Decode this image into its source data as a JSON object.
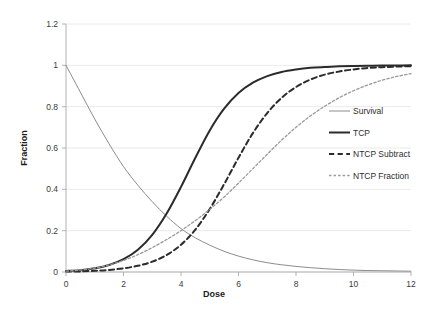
{
  "chart_data": {
    "type": "line",
    "title": "",
    "xlabel": "Dose",
    "ylabel": "Fraction",
    "xlim": [
      0,
      12
    ],
    "ylim": [
      0,
      1.2
    ],
    "xticks": [
      0,
      2,
      4,
      6,
      8,
      10,
      12
    ],
    "yticks": [
      0,
      0.2,
      0.4,
      0.6,
      0.8,
      1,
      1.2
    ],
    "xtick_labels": [
      "0",
      "2",
      "4",
      "6",
      "8",
      "10",
      "12"
    ],
    "ytick_labels": [
      "0",
      "0.2",
      "0.4",
      "0.6",
      "0.8",
      "1",
      "1.2"
    ],
    "grid": true,
    "legend_position": "right-middle",
    "series": [
      {
        "name": "Survival",
        "style": "solid",
        "color": "#8c8c8c",
        "width": 1.0,
        "x": [
          0,
          0.5,
          1,
          1.5,
          2,
          2.5,
          3,
          3.5,
          4,
          4.5,
          5,
          5.5,
          6,
          6.5,
          7,
          7.5,
          8,
          8.5,
          9,
          9.5,
          10,
          10.5,
          11,
          11.5,
          12
        ],
        "y": [
          1.0,
          0.87,
          0.74,
          0.62,
          0.51,
          0.42,
          0.34,
          0.27,
          0.21,
          0.165,
          0.13,
          0.1,
          0.077,
          0.059,
          0.045,
          0.035,
          0.027,
          0.021,
          0.016,
          0.012,
          0.009,
          0.007,
          0.006,
          0.005,
          0.004
        ]
      },
      {
        "name": "TCP",
        "style": "solid",
        "color": "#2b2b2b",
        "width": 2.0,
        "x": [
          0,
          0.5,
          1,
          1.5,
          2,
          2.5,
          3,
          3.5,
          4,
          4.5,
          5,
          5.5,
          6,
          6.5,
          7,
          7.5,
          8,
          8.5,
          9,
          9.5,
          10,
          10.5,
          11,
          11.5,
          12
        ],
        "y": [
          0.005,
          0.009,
          0.018,
          0.034,
          0.062,
          0.108,
          0.18,
          0.283,
          0.412,
          0.553,
          0.685,
          0.79,
          0.866,
          0.916,
          0.948,
          0.968,
          0.98,
          0.988,
          0.992,
          0.995,
          0.997,
          0.998,
          0.999,
          0.999,
          1.0
        ]
      },
      {
        "name": "NTCP Subtract",
        "style": "dashed",
        "color": "#2b2b2b",
        "width": 2.0,
        "x": [
          0,
          0.5,
          1,
          1.5,
          2,
          2.5,
          3,
          3.5,
          4,
          4.5,
          5,
          5.5,
          6,
          6.5,
          7,
          7.5,
          8,
          8.5,
          9,
          9.5,
          10,
          10.5,
          11,
          11.5,
          12
        ],
        "y": [
          0.002,
          0.003,
          0.006,
          0.01,
          0.018,
          0.03,
          0.05,
          0.082,
          0.132,
          0.205,
          0.305,
          0.425,
          0.553,
          0.672,
          0.769,
          0.843,
          0.895,
          0.931,
          0.955,
          0.97,
          0.98,
          0.987,
          0.991,
          0.994,
          0.996
        ]
      },
      {
        "name": "NTCP Fraction",
        "style": "dotted",
        "color": "#9a9a9a",
        "width": 1.3,
        "x": [
          0,
          0.5,
          1,
          1.5,
          2,
          2.5,
          3,
          3.5,
          4,
          4.5,
          5,
          5.5,
          6,
          6.5,
          7,
          7.5,
          8,
          8.5,
          9,
          9.5,
          10,
          10.5,
          11,
          11.5,
          12
        ],
        "y": [
          0.004,
          0.009,
          0.019,
          0.034,
          0.056,
          0.084,
          0.118,
          0.157,
          0.2,
          0.249,
          0.303,
          0.363,
          0.43,
          0.5,
          0.57,
          0.638,
          0.7,
          0.755,
          0.802,
          0.843,
          0.877,
          0.905,
          0.928,
          0.946,
          0.96
        ]
      }
    ]
  },
  "legend": {
    "items": [
      {
        "label": "Survival"
      },
      {
        "label": "TCP"
      },
      {
        "label": "NTCP Subtract"
      },
      {
        "label": "NTCP Fraction"
      }
    ]
  }
}
